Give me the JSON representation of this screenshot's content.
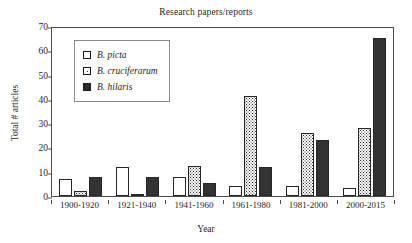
{
  "chart_data": {
    "type": "bar",
    "title": "Research papers/reports",
    "xlabel": "Year",
    "ylabel": "Total # articles",
    "categories": [
      "1900-1920",
      "1921-1940",
      "1941-1960",
      "1961-1980",
      "1981-2000",
      "2000-2015"
    ],
    "series": [
      {
        "name": "B. picta",
        "values": [
          7,
          12,
          8,
          4,
          4,
          3.5
        ],
        "fill": "open-white"
      },
      {
        "name": "B. cruciferarum",
        "values": [
          2,
          1,
          12.5,
          41,
          26,
          28
        ],
        "fill": "dotted-stipple"
      },
      {
        "name": "B. hilaris",
        "values": [
          8,
          8,
          5.5,
          12,
          23,
          65
        ],
        "fill": "solid-dark"
      }
    ],
    "ylim": [
      0,
      70
    ],
    "yticks": [
      0,
      10,
      20,
      30,
      40,
      50,
      60,
      70
    ],
    "grid": false,
    "legend_position": "upper-left-inside"
  },
  "colors": {
    "series_open": "#ffffff",
    "series_dotted": "#2b2b2b",
    "series_solid": "#333333",
    "axis": "#4d4d4d",
    "text": "#1f1f1f",
    "background": "#ffffff"
  }
}
